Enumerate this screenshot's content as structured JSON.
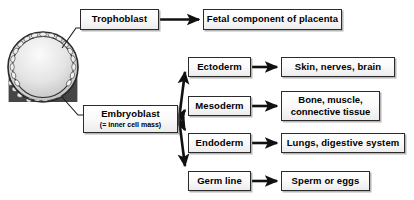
{
  "diagram": {
    "type": "flow-diagram",
    "colors": {
      "background": "#ffffff",
      "box_border": "#2b2b2b",
      "box_fill_light": "#ffffff",
      "box_fill_dark": "#ececec",
      "arrow": "#111111",
      "cell_dark": "#3a3a3a",
      "cavity_light": "#f2f2f2",
      "cavity_mid": "#c9c9c9"
    }
  },
  "illustration": {
    "name": "blastocyst",
    "label": "blastocyst-cross-section",
    "parts": [
      {
        "name": "trophoblast-ring",
        "description": "outer ring of flattened cells"
      },
      {
        "name": "blastocoel-cavity",
        "description": "fluid filled cavity, light gradient"
      },
      {
        "name": "inner-cell-mass",
        "description": "dense cluster of cells at lower portion"
      }
    ]
  },
  "nodes": {
    "trophoblast": {
      "label": "Trophoblast"
    },
    "placenta": {
      "label": "Fetal component of placenta"
    },
    "embryoblast": {
      "label": "Embryoblast",
      "sublabel": "(= inner cell mass)"
    },
    "ectoderm": {
      "label": "Ectoderm"
    },
    "skin": {
      "label": "Skin, nerves, brain"
    },
    "mesoderm": {
      "label": "Mesoderm"
    },
    "bone": {
      "line1": "Bone, muscle,",
      "line2": "connective tissue"
    },
    "endoderm": {
      "label": "Endoderm"
    },
    "lungs": {
      "label": "Lungs, digestive system"
    },
    "germline": {
      "label": "Germ line"
    },
    "sperm": {
      "label": "Sperm or eggs"
    }
  },
  "connections": [
    {
      "name": "leader-trophoblast",
      "from": "blastocyst-outer-ring",
      "to": "trophoblast",
      "style": "thin-leader-line"
    },
    {
      "name": "arrow-trophoblast-placenta",
      "from": "trophoblast",
      "to": "placenta",
      "style": "thick-arrow"
    },
    {
      "name": "leader-embryoblast",
      "from": "inner-cell-mass",
      "to": "embryoblast",
      "style": "thin-leader-line"
    },
    {
      "name": "arrow-embryoblast-ectoderm",
      "from": "embryoblast",
      "to": "ectoderm",
      "style": "thick-arrow"
    },
    {
      "name": "arrow-embryoblast-mesoderm",
      "from": "embryoblast",
      "to": "mesoderm",
      "style": "thick-arrow"
    },
    {
      "name": "arrow-embryoblast-endoderm",
      "from": "embryoblast",
      "to": "endoderm",
      "style": "thick-arrow"
    },
    {
      "name": "arrow-embryoblast-germline",
      "from": "embryoblast",
      "to": "germline",
      "style": "thick-arrow"
    },
    {
      "name": "arrow-ectoderm-skin",
      "from": "ectoderm",
      "to": "skin",
      "style": "thick-arrow"
    },
    {
      "name": "arrow-mesoderm-bone",
      "from": "mesoderm",
      "to": "bone",
      "style": "thick-arrow"
    },
    {
      "name": "arrow-endoderm-lungs",
      "from": "endoderm",
      "to": "lungs",
      "style": "thick-arrow"
    },
    {
      "name": "arrow-germline-sperm",
      "from": "germline",
      "to": "sperm",
      "style": "thick-arrow"
    }
  ]
}
